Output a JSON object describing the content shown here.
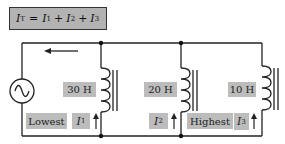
{
  "equation": {
    "text": "I_T = I_1 + I_2 + I_3",
    "lhs": "I",
    "lhs_sub": "T",
    "terms": [
      {
        "symbol": "I",
        "sub": "1"
      },
      {
        "symbol": "I",
        "sub": "2"
      },
      {
        "symbol": "I",
        "sub": "3"
      }
    ],
    "equals": "=",
    "plus": "+"
  },
  "source": {
    "type": "ac-voltage-source",
    "icon": "sine-wave-icon"
  },
  "total_current_arrow": {
    "direction": "left"
  },
  "branches": [
    {
      "inductance_label": "30 H",
      "current_symbol": "I",
      "current_sub": "1",
      "magnitude_label": "Lowest",
      "arrow_direction": "up"
    },
    {
      "inductance_label": "20 H",
      "current_symbol": "I",
      "current_sub": "2",
      "magnitude_label": "",
      "arrow_direction": "up"
    },
    {
      "inductance_label": "10 H",
      "current_symbol": "I",
      "current_sub": "3",
      "magnitude_label": "Highest",
      "arrow_direction": "up"
    }
  ],
  "colors": {
    "wire": "#222222",
    "equation_box_fill": "#b3b3b3",
    "label_box_fill": "#bcbcbc",
    "background": "#ffffff"
  }
}
